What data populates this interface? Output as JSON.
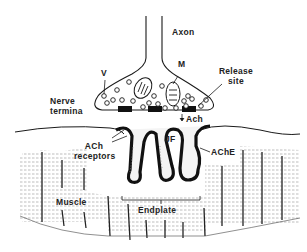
{
  "diagram": {
    "type": "neuromuscular-junction",
    "labels": {
      "axon": "Axon",
      "vesicle": "V",
      "mitochondrion": "M",
      "release_site_1": "Release",
      "release_site_2": "site",
      "nerve_terminal_1": "Nerve",
      "nerve_terminal_2": "termina",
      "ach": "Ach",
      "ach_receptors_1": "ACh",
      "ach_receptors_2": "receptors",
      "junctional_folds": "JF",
      "ache": "AChE",
      "muscle": "Muscle",
      "endplate": "Endplate"
    },
    "colors": {
      "ink": "#1a1a1a",
      "background": "#ffffff",
      "hatch": "#9a9a9a"
    }
  }
}
